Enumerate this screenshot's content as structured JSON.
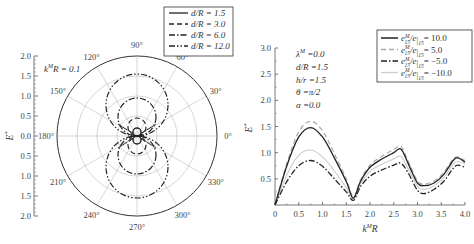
{
  "chart_data": [
    {
      "type": "polar",
      "title": "",
      "annotation": "k^M R = 0.1",
      "ylabel": "E*",
      "radial_ticks": [
        "2.0",
        "1.5",
        "1.0",
        "0.5",
        "0.0",
        "0.5",
        "1.0",
        "1.5",
        "2.0"
      ],
      "radial_range": [
        0,
        2.0
      ],
      "angle_labels": [
        "0°",
        "30°",
        "60°",
        "90°",
        "120°",
        "150°",
        "180°",
        "210°",
        "240°",
        "270°",
        "300°",
        "330°"
      ],
      "grid": true,
      "legend_position": "upper-right",
      "series": [
        {
          "name": "d/R = 1.5",
          "style": "solid",
          "peak": 0.2
        },
        {
          "name": "d/R = 3.0",
          "style": "dashed",
          "peak": 0.45
        },
        {
          "name": "d/R = 6.0",
          "style": "dash-dot",
          "peak": 0.95
        },
        {
          "name": "d/R = 12.0",
          "style": "dash-dot-dot",
          "peak": 1.55
        }
      ]
    },
    {
      "type": "line",
      "title": "",
      "xlabel": "k^M R",
      "ylabel": "E*",
      "xlim": [
        0,
        4.0
      ],
      "ylim": [
        0,
        3.0
      ],
      "xticks": [
        "0",
        "0.5",
        "1.0",
        "1.5",
        "2.0",
        "2.5",
        "3.0",
        "3.5",
        "4.0"
      ],
      "yticks": [
        "0.5",
        "1.0",
        "1.5",
        "2.0",
        "2.5",
        "3.0"
      ],
      "annotations": [
        "λ^M = 0.0",
        "d/R = 1.5",
        "h/r = 1.5",
        "θ = π/2",
        "α = 0.0"
      ],
      "legend_position": "upper-right",
      "x": [
        0,
        0.25,
        0.5,
        0.75,
        1.0,
        1.25,
        1.5,
        1.65,
        1.8,
        2.0,
        2.25,
        2.5,
        2.65,
        2.8,
        3.0,
        3.15,
        3.35,
        3.55,
        3.75,
        3.85,
        4.0
      ],
      "series": [
        {
          "name": "e15M/e15 = 10.0",
          "style": "solid",
          "values": [
            0,
            0.75,
            1.3,
            1.48,
            1.3,
            0.9,
            0.45,
            0.13,
            0.45,
            0.72,
            0.88,
            1.0,
            1.07,
            0.8,
            0.42,
            0.37,
            0.42,
            0.58,
            0.85,
            0.9,
            0.82
          ]
        },
        {
          "name": "e15M/e15 = 5.0",
          "style": "dashed-light",
          "values": [
            0,
            0.8,
            1.4,
            1.6,
            1.42,
            0.98,
            0.5,
            0.15,
            0.48,
            0.76,
            0.93,
            1.06,
            1.12,
            0.85,
            0.46,
            0.4,
            0.46,
            0.62,
            0.88,
            0.92,
            0.85
          ]
        },
        {
          "name": "e15M/e15 = -5.0",
          "style": "dash-dot",
          "values": [
            0,
            0.45,
            0.75,
            0.85,
            0.74,
            0.5,
            0.25,
            0.09,
            0.35,
            0.55,
            0.67,
            0.76,
            0.8,
            0.62,
            0.28,
            0.22,
            0.3,
            0.45,
            0.7,
            0.76,
            0.72
          ]
        },
        {
          "name": "e15M/e15 = -10.0",
          "style": "solid-light",
          "values": [
            0,
            0.58,
            0.95,
            1.05,
            0.92,
            0.65,
            0.33,
            0.12,
            0.4,
            0.64,
            0.78,
            0.88,
            0.93,
            0.7,
            0.36,
            0.3,
            0.37,
            0.52,
            0.78,
            0.83,
            0.78
          ]
        }
      ]
    }
  ],
  "left": {
    "annotation": "k",
    "annotation_sup": "M",
    "annotation_rest": "R = 0.1",
    "ylabel": "E",
    "ylabel_sup": "*",
    "legend": [
      "d/R = 1.5",
      "d/R = 3.0",
      "d/R = 6.0",
      "d/R = 12.0"
    ]
  },
  "right": {
    "ylabel": "E",
    "ylabel_sup": "*",
    "xlabel": "k",
    "xlabel_sup": "M",
    "xlabel_rest": "R",
    "params": [
      "λ",
      "M",
      " =0.0",
      "d/R =1.5",
      "h/r =1.5",
      "θ =π/2",
      "α =0.0"
    ],
    "legend": [
      "= 10.0",
      "= 5.0",
      "= −5.0",
      "= −10.0"
    ]
  }
}
